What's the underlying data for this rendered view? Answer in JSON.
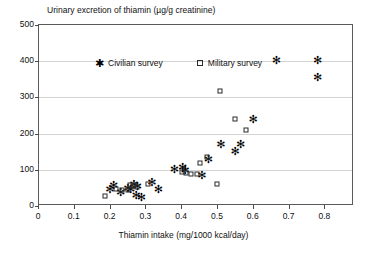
{
  "chart_data": {
    "type": "scatter",
    "title": "Urinary excretion of thiamin (µg/g creatinine)",
    "xlabel": "Thiamin intake (mg/1000 kcal/day)",
    "ylabel": "",
    "xlim": [
      0,
      0.88
    ],
    "ylim": [
      0,
      500
    ],
    "xticks": [
      "0",
      "0.1",
      "0.2",
      "0.3",
      "0.4",
      "0.5",
      "0.6",
      "0.7",
      "0.8"
    ],
    "xtick_values": [
      0,
      0.1,
      0.2,
      0.3,
      0.4,
      0.5,
      0.6,
      0.7,
      0.8
    ],
    "yticks": [
      "0",
      "100",
      "200",
      "300",
      "400",
      "500"
    ],
    "ytick_values": [
      0,
      100,
      200,
      300,
      400,
      500
    ],
    "grid": "horizontal",
    "legend_position": "top-left-inside",
    "series": [
      {
        "name": "Civilian survey",
        "marker": "asterisk",
        "color": "#000000",
        "points": [
          [
            0.195,
            48
          ],
          [
            0.205,
            58
          ],
          [
            0.225,
            40
          ],
          [
            0.245,
            50
          ],
          [
            0.253,
            46
          ],
          [
            0.262,
            62
          ],
          [
            0.268,
            30
          ],
          [
            0.272,
            55
          ],
          [
            0.283,
            24
          ],
          [
            0.312,
            66
          ],
          [
            0.33,
            48
          ],
          [
            0.375,
            103
          ],
          [
            0.398,
            108
          ],
          [
            0.405,
            100
          ],
          [
            0.452,
            85
          ],
          [
            0.47,
            130
          ],
          [
            0.505,
            172
          ],
          [
            0.545,
            152
          ],
          [
            0.56,
            170
          ],
          [
            0.595,
            240
          ],
          [
            0.66,
            403
          ],
          [
            0.775,
            403
          ],
          [
            0.775,
            355
          ]
        ]
      },
      {
        "name": "Military survey",
        "marker": "open-square",
        "color": "#2b2b2b",
        "points": [
          [
            0.185,
            28
          ],
          [
            0.215,
            46
          ],
          [
            0.232,
            44
          ],
          [
            0.248,
            44
          ],
          [
            0.255,
            58
          ],
          [
            0.262,
            56
          ],
          [
            0.268,
            58
          ],
          [
            0.275,
            52
          ],
          [
            0.305,
            62
          ],
          [
            0.4,
            95
          ],
          [
            0.412,
            92
          ],
          [
            0.425,
            88
          ],
          [
            0.442,
            88
          ],
          [
            0.45,
            118
          ],
          [
            0.468,
            135
          ],
          [
            0.498,
            60
          ],
          [
            0.505,
            318
          ],
          [
            0.548,
            240
          ],
          [
            0.578,
            210
          ]
        ]
      }
    ]
  },
  "legend": {
    "items": [
      {
        "label": "Civilian survey",
        "marker": "asterisk-marker"
      },
      {
        "label": "Military survey",
        "marker": "open-square-marker"
      }
    ]
  }
}
